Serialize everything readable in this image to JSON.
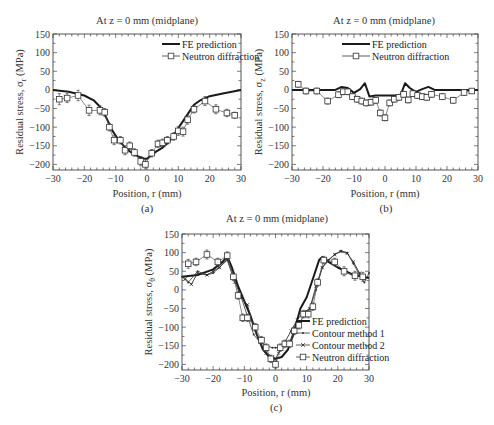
{
  "chart_data": [
    {
      "type": "line",
      "panel": "(a)",
      "title": "At z = 0 mm (midplane)",
      "xlabel": "Position, r (mm)",
      "ylabel": "Residual stress, σr (MPa)",
      "ylabel_main": "Residual stress, σ",
      "ylabel_sub": "r",
      "ylabel_unit": " (MPa)",
      "xlim": [
        -30,
        30
      ],
      "ylim": [
        -215,
        150
      ],
      "xticks": [
        -30,
        -20,
        -10,
        0,
        10,
        20,
        30
      ],
      "yticks": [
        150,
        100,
        50,
        0,
        -50,
        -100,
        -150,
        -200
      ],
      "xtick_labels": [
        "−30",
        "−20",
        "−10",
        "0",
        "10",
        "20",
        "30"
      ],
      "ytick_labels": [
        "150",
        "100",
        "50",
        "0",
        "−50",
        "−100",
        "−150",
        "−200"
      ],
      "legend_position": "top-right",
      "series": [
        {
          "name": "FE prediction",
          "style": "thick-line",
          "x": [
            -30,
            -25,
            -20,
            -17,
            -15,
            -13,
            -11,
            -9,
            -7,
            -5,
            -3,
            -1,
            0,
            1,
            3,
            5,
            7,
            9,
            11,
            13,
            15,
            17,
            20,
            25,
            30
          ],
          "y": [
            0,
            -5,
            -15,
            -28,
            -45,
            -75,
            -110,
            -135,
            -155,
            -168,
            -178,
            -184,
            -185,
            -178,
            -165,
            -155,
            -140,
            -115,
            -90,
            -65,
            -40,
            -28,
            -17,
            -8,
            0
          ]
        },
        {
          "name": "Neutron diffraction",
          "style": "square-markers",
          "x": [
            -28,
            -25.5,
            -22,
            -18.5,
            -15,
            -13.5,
            -12,
            -10.5,
            -8.5,
            -7,
            -5.5,
            -4,
            -2,
            -0.5,
            1.5,
            3.5,
            5,
            6.5,
            8.5,
            10,
            11.5,
            13,
            15,
            18.5,
            22,
            25.5,
            28
          ],
          "y": [
            -25,
            -22,
            -15,
            -55,
            -55,
            -60,
            -100,
            -135,
            -135,
            -162,
            -150,
            -168,
            -192,
            -200,
            -170,
            -145,
            -142,
            -135,
            -125,
            -110,
            -112,
            -80,
            -52,
            -30,
            -52,
            -62,
            -68
          ],
          "err": [
            15,
            12,
            14,
            14,
            12,
            10,
            10,
            12,
            10,
            12,
            10,
            10,
            12,
            12,
            10,
            10,
            10,
            10,
            10,
            12,
            12,
            12,
            10,
            12,
            12,
            10,
            8
          ]
        }
      ],
      "caption": "(a)"
    },
    {
      "type": "line",
      "panel": "(b)",
      "title": "At z = 0 mm (midplane)",
      "xlabel": "Position, r (mm)",
      "ylabel": "Residual stress, σz (MPa)",
      "ylabel_main": "Residual stress, σ",
      "ylabel_sub": "z",
      "ylabel_unit": " (MPa)",
      "xlim": [
        -30,
        30
      ],
      "ylim": [
        -215,
        150
      ],
      "xticks": [
        -30,
        -20,
        -10,
        0,
        10,
        20,
        30
      ],
      "yticks": [
        150,
        100,
        50,
        0,
        -50,
        -100,
        -150,
        -200
      ],
      "xtick_labels": [
        "−30",
        "−20",
        "−10",
        "0",
        "10",
        "20",
        "30"
      ],
      "ytick_labels": [
        "150",
        "100",
        "50",
        "0",
        "−50",
        "−100",
        "−150",
        "−200"
      ],
      "legend_position": "top-center",
      "series": [
        {
          "name": "FE prediction",
          "style": "thick-line",
          "x": [
            -30,
            -20,
            -16,
            -14,
            -12,
            -10,
            -8,
            -6.5,
            -5,
            -3,
            0,
            3,
            5,
            6.5,
            8,
            10,
            12,
            14,
            16,
            20,
            30
          ],
          "y": [
            0,
            0,
            0,
            8,
            5,
            -8,
            2,
            18,
            -18,
            -15,
            -15,
            -15,
            -15,
            18,
            5,
            -5,
            2,
            8,
            0,
            0,
            0
          ]
        },
        {
          "name": "Neutron diffraction",
          "style": "square-markers",
          "x": [
            -28,
            -25.5,
            -22,
            -18.5,
            -15,
            -13.5,
            -12,
            -10.5,
            -9,
            -7.5,
            -6,
            -4.5,
            -3,
            -1.5,
            0,
            1.5,
            3,
            4.5,
            6,
            7.5,
            9,
            10.5,
            12,
            13.5,
            15,
            18.5,
            22,
            25.5,
            28
          ],
          "y": [
            15,
            -3,
            -3,
            -30,
            -13,
            -5,
            -5,
            -18,
            -25,
            -30,
            -35,
            -33,
            -28,
            -62,
            -75,
            -35,
            -25,
            -20,
            -12,
            -27,
            -10,
            -15,
            -18,
            -20,
            -12,
            -18,
            -28,
            -7,
            -3
          ],
          "err": [
            8,
            8,
            8,
            8,
            8,
            8,
            8,
            8,
            8,
            8,
            8,
            8,
            8,
            8,
            8,
            8,
            8,
            8,
            8,
            8,
            8,
            8,
            8,
            8,
            8,
            8,
            8,
            8,
            6
          ]
        }
      ],
      "caption": "(b)"
    },
    {
      "type": "line",
      "panel": "(c)",
      "title": "At z = 0 mm (midplane)",
      "xlabel": "Position, r (mm)",
      "ylabel": "Residual stress, σθ (MPa)",
      "ylabel_main": "Residual stress, σ",
      "ylabel_sub": "θ",
      "ylabel_unit": " (MPa)",
      "xlim": [
        -30,
        30
      ],
      "ylim": [
        -215,
        150
      ],
      "xticks": [
        -30,
        -20,
        -10,
        0,
        10,
        20,
        30
      ],
      "yticks": [
        150,
        100,
        50,
        0,
        -50,
        -100,
        -150,
        -200
      ],
      "xtick_labels": [
        "−30",
        "−20",
        "−10",
        "0",
        "10",
        "20",
        "30"
      ],
      "ytick_labels": [
        "150",
        "100",
        "50",
        "0",
        "−50",
        "−100",
        "−150",
        "−200"
      ],
      "legend_position": "bottom-right",
      "series": [
        {
          "name": "FE prediction",
          "style": "thick-line",
          "x": [
            -30,
            -25,
            -20,
            -17,
            -15.5,
            -14,
            -12,
            -10,
            -8,
            -6,
            -4,
            -2,
            0,
            2,
            4,
            6,
            8,
            10,
            12,
            14,
            15,
            17,
            20,
            25,
            30
          ],
          "y": [
            35,
            40,
            55,
            75,
            90,
            60,
            10,
            -30,
            -70,
            -120,
            -160,
            -180,
            -185,
            -180,
            -160,
            -110,
            -50,
            -20,
            30,
            80,
            88,
            75,
            60,
            40,
            32
          ],
          "color": "#111111"
        },
        {
          "name": "Contour method 1",
          "style": "thin-line-dot",
          "x": [
            -30,
            -28,
            -25,
            -22,
            -20,
            -18,
            -15.5,
            -13,
            -11,
            -9,
            -7,
            -5,
            -3,
            -1,
            0,
            1,
            3,
            5,
            7,
            9,
            11,
            13,
            15,
            17,
            19,
            21,
            23,
            25,
            27,
            28.5,
            30
          ],
          "y": [
            35,
            20,
            50,
            40,
            45,
            60,
            85,
            30,
            -20,
            -70,
            -120,
            -140,
            -150,
            -155,
            -155,
            -155,
            -150,
            -140,
            -100,
            -70,
            -50,
            0,
            60,
            80,
            95,
            105,
            100,
            70,
            40,
            20,
            45
          ]
        },
        {
          "name": "Contour method 2",
          "style": "thin-line-x",
          "x": [
            -29,
            -27,
            -25,
            -22,
            -20,
            -18,
            -15.5,
            -13,
            -11,
            -9,
            -7,
            -5,
            -3,
            -1,
            0,
            1,
            3,
            5,
            7,
            9,
            11,
            13,
            15,
            17,
            19,
            21,
            23,
            25,
            27,
            28.5
          ],
          "y": [
            30,
            15,
            45,
            40,
            50,
            60,
            80,
            20,
            -20,
            -40,
            -100,
            -140,
            -170,
            -180,
            -185,
            -170,
            -140,
            -110,
            -80,
            -60,
            -50,
            10,
            60,
            80,
            95,
            103,
            98,
            75,
            45,
            30
          ]
        },
        {
          "name": "Neutron diffraction",
          "style": "square-markers",
          "x": [
            -28,
            -25.5,
            -22,
            -18.5,
            -15.5,
            -13.5,
            -12,
            -10.5,
            -9,
            -6.5,
            -4.5,
            -3,
            -1.5,
            0,
            1.5,
            3,
            4.5,
            6,
            7.5,
            9,
            10.5,
            12,
            13.5,
            15.5,
            19,
            22,
            25.5,
            28
          ],
          "y": [
            70,
            75,
            95,
            75,
            92,
            35,
            -15,
            -75,
            -75,
            -100,
            -135,
            -155,
            -185,
            -200,
            -155,
            -145,
            -145,
            -110,
            -95,
            -65,
            -65,
            -45,
            20,
            80,
            75,
            50,
            38,
            35
          ],
          "err": [
            12,
            10,
            12,
            10,
            10,
            10,
            10,
            10,
            10,
            10,
            10,
            10,
            10,
            10,
            10,
            10,
            10,
            10,
            10,
            10,
            10,
            10,
            10,
            10,
            10,
            12,
            12,
            12
          ]
        }
      ],
      "caption": "(c)"
    }
  ]
}
